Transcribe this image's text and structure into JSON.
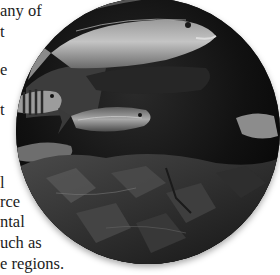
{
  "page": {
    "text_lines": [
      {
        "text": "any of",
        "x": 0,
        "y": 1
      },
      {
        "text": "t",
        "x": 0,
        "y": 22
      },
      {
        "text": "e",
        "x": 0,
        "y": 60
      },
      {
        "text": "t",
        "x": 0,
        "y": 100
      },
      {
        "text": "l",
        "x": 0,
        "y": 173
      },
      {
        "text": "rce",
        "x": 0,
        "y": 192
      },
      {
        "text": "ntal",
        "x": 0,
        "y": 212
      },
      {
        "text": "uch as",
        "x": 0,
        "y": 233
      },
      {
        "text": "e regions.",
        "x": 0,
        "y": 254
      }
    ]
  },
  "photo": {
    "shape": "circle",
    "subject": "cichlid fish swimming over dark rocks",
    "colors": {
      "background": "#0b0b0b",
      "fish_light": "#b8b8b8",
      "fish_mid": "#7a7a7a",
      "rock": "#3a3a3a"
    }
  }
}
